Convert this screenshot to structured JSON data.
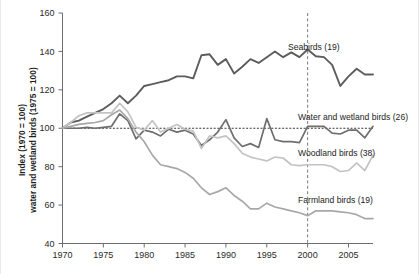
{
  "chart_data": {
    "type": "line",
    "title": "",
    "xlabel": "",
    "ylabel_line1": "Index (1970 = 100)",
    "ylabel_line2": "water and wetland birds (1975 = 100)",
    "xlim": [
      1970,
      2008
    ],
    "ylim": [
      40,
      160
    ],
    "xticks": [
      1970,
      1975,
      1980,
      1985,
      1990,
      1995,
      2000,
      2005
    ],
    "yticks": [
      40,
      60,
      80,
      100,
      120,
      140,
      160
    ],
    "grid": false,
    "legend_position": "inline-right-annotations",
    "annotations": [
      {
        "name": "baseline-100",
        "type": "horizontal-dashed-line",
        "value": 100
      },
      {
        "name": "year-2000-marker",
        "type": "vertical-dashed-line",
        "value": 2000
      }
    ],
    "x": [
      1970,
      1971,
      1972,
      1973,
      1974,
      1975,
      1976,
      1977,
      1978,
      1979,
      1980,
      1981,
      1982,
      1983,
      1984,
      1985,
      1986,
      1987,
      1988,
      1989,
      1990,
      1991,
      1992,
      1993,
      1994,
      1995,
      1996,
      1997,
      1998,
      1999,
      2000,
      2001,
      2002,
      2003,
      2004,
      2005,
      2006,
      2007,
      2008
    ],
    "series": [
      {
        "name": "Seabirds (19)",
        "label": "Seabirds (19)",
        "color": "#5c5c5c",
        "count": 19,
        "values": [
          100,
          103,
          104,
          106,
          108,
          110,
          113,
          117,
          113,
          117,
          122,
          123,
          124,
          125,
          127,
          127,
          126,
          138,
          138.5,
          133,
          136,
          128.5,
          132,
          136,
          134,
          137,
          140,
          137,
          139.5,
          137,
          141,
          137.5,
          137,
          133,
          122,
          127,
          131,
          128,
          128
        ]
      },
      {
        "name": "Water and wetland birds (26)",
        "label": "Water and wetland birds (26)",
        "color": "#6e6e6e",
        "count": 26,
        "values": [
          100,
          100,
          100,
          100.5,
          100,
          100.5,
          101,
          107.5,
          104,
          94.5,
          99,
          98,
          96,
          99.5,
          98,
          99,
          97,
          91,
          94,
          98,
          104.5,
          95,
          90.5,
          92,
          90,
          105,
          94,
          93,
          93,
          92.5,
          101,
          101,
          101,
          97.5,
          97,
          99,
          99,
          95,
          101
        ]
      },
      {
        "name": "Woodland birds (38)",
        "label": "Woodland birds (38)",
        "color": "#c3c3c3",
        "count": 38,
        "values": [
          100,
          103,
          106.5,
          108,
          108,
          108,
          108,
          113,
          108.5,
          100.5,
          99,
          104,
          98,
          100,
          102,
          99.5,
          98.5,
          89.5,
          96,
          95,
          96,
          92,
          87,
          85,
          84,
          83,
          85,
          84.5,
          81,
          80.5,
          81,
          81,
          81,
          80,
          77.5,
          78,
          82,
          78,
          86
        ]
      },
      {
        "name": "Farmland birds (19)",
        "label": "Farmland birds (19)",
        "color": "#a8a8a8",
        "count": 19,
        "values": [
          100,
          101,
          102,
          102.5,
          103,
          104,
          107,
          109.5,
          105,
          98,
          93,
          86,
          81,
          80,
          79,
          77,
          74,
          69,
          65.5,
          67,
          69,
          65,
          62,
          58,
          58,
          61,
          59,
          58,
          57,
          56,
          54.5,
          57,
          57,
          57,
          56.5,
          56,
          55,
          53,
          53
        ]
      }
    ]
  },
  "figure": {
    "background_color": "#ffffff",
    "axis_color": "#6d6d6d",
    "baseline_color": "#3a3a3a"
  }
}
